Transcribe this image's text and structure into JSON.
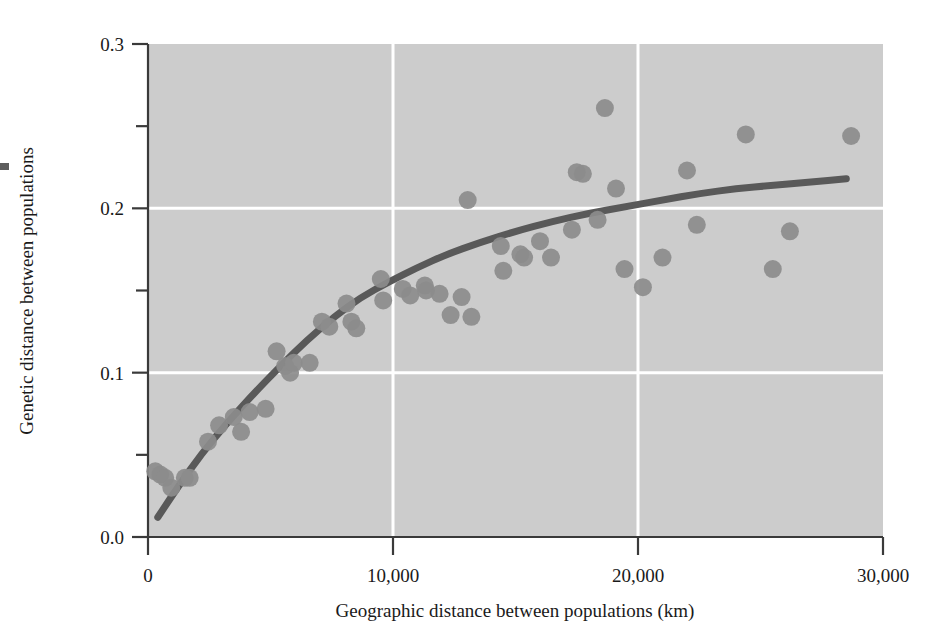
{
  "chart_data": {
    "type": "scatter",
    "title": "",
    "xlabel": "Geographic distance between populations (km)",
    "ylabel": "Genetic distance between populations",
    "xlim": [
      0,
      30000
    ],
    "ylim": [
      0.0,
      0.3
    ],
    "grid": true,
    "grid_color": "#ffffff",
    "plot_background": "#cccccc",
    "point_color": "#8c8c8c",
    "line_color": "#595959",
    "axis_color": "#3a3a3a",
    "legend": null,
    "xticks": [
      {
        "value": 0,
        "label": "0"
      },
      {
        "value": 10000,
        "label": "10,000"
      },
      {
        "value": 20000,
        "label": "20,000"
      },
      {
        "value": 30000,
        "label": "30,000"
      }
    ],
    "yticks": [
      {
        "value": 0.0,
        "label": "0.0"
      },
      {
        "value": 0.05,
        "label": ""
      },
      {
        "value": 0.1,
        "label": "0.1"
      },
      {
        "value": 0.15,
        "label": ""
      },
      {
        "value": 0.2,
        "label": "0.2"
      },
      {
        "value": 0.25,
        "label": ""
      },
      {
        "value": 0.3,
        "label": "0.3"
      }
    ],
    "series": [
      {
        "name": "Population pairs",
        "marker": "circle",
        "points": [
          [
            300,
            0.04
          ],
          [
            500,
            0.038
          ],
          [
            700,
            0.036
          ],
          [
            950,
            0.03
          ],
          [
            1500,
            0.036
          ],
          [
            1700,
            0.036
          ],
          [
            2450,
            0.058
          ],
          [
            2900,
            0.068
          ],
          [
            3500,
            0.073
          ],
          [
            3800,
            0.064
          ],
          [
            4150,
            0.076
          ],
          [
            4800,
            0.078
          ],
          [
            5250,
            0.113
          ],
          [
            5600,
            0.104
          ],
          [
            5800,
            0.1
          ],
          [
            5950,
            0.106
          ],
          [
            6600,
            0.106
          ],
          [
            7100,
            0.131
          ],
          [
            7400,
            0.128
          ],
          [
            8100,
            0.142
          ],
          [
            8300,
            0.131
          ],
          [
            8500,
            0.127
          ],
          [
            9500,
            0.157
          ],
          [
            9600,
            0.144
          ],
          [
            10400,
            0.151
          ],
          [
            10700,
            0.147
          ],
          [
            11300,
            0.153
          ],
          [
            11350,
            0.15
          ],
          [
            11900,
            0.148
          ],
          [
            12350,
            0.135
          ],
          [
            12800,
            0.146
          ],
          [
            13050,
            0.205
          ],
          [
            13200,
            0.134
          ],
          [
            14400,
            0.177
          ],
          [
            14500,
            0.162
          ],
          [
            15200,
            0.172
          ],
          [
            15350,
            0.17
          ],
          [
            16000,
            0.18
          ],
          [
            16450,
            0.17
          ],
          [
            17300,
            0.187
          ],
          [
            17500,
            0.222
          ],
          [
            17750,
            0.221
          ],
          [
            18350,
            0.193
          ],
          [
            18650,
            0.261
          ],
          [
            19100,
            0.212
          ],
          [
            19450,
            0.163
          ],
          [
            20200,
            0.152
          ],
          [
            21000,
            0.17
          ],
          [
            22000,
            0.223
          ],
          [
            22400,
            0.19
          ],
          [
            24400,
            0.245
          ],
          [
            25500,
            0.163
          ],
          [
            26200,
            0.186
          ],
          [
            28700,
            0.244
          ]
        ]
      }
    ],
    "fit_curve": {
      "name": "Fitted trend",
      "style": "solid",
      "points": [
        [
          400,
          0.012
        ],
        [
          1200,
          0.03
        ],
        [
          2200,
          0.051
        ],
        [
          3200,
          0.069
        ],
        [
          4300,
          0.087
        ],
        [
          5400,
          0.104
        ],
        [
          6500,
          0.12
        ],
        [
          7600,
          0.134
        ],
        [
          8700,
          0.146
        ],
        [
          9800,
          0.155
        ],
        [
          11000,
          0.164
        ],
        [
          12200,
          0.172
        ],
        [
          13500,
          0.179
        ],
        [
          15000,
          0.186
        ],
        [
          16500,
          0.192
        ],
        [
          18000,
          0.197
        ],
        [
          19500,
          0.201
        ],
        [
          21000,
          0.205
        ],
        [
          22500,
          0.209
        ],
        [
          24000,
          0.212
        ],
        [
          25500,
          0.214
        ],
        [
          27000,
          0.216
        ],
        [
          28500,
          0.218
        ]
      ]
    }
  }
}
